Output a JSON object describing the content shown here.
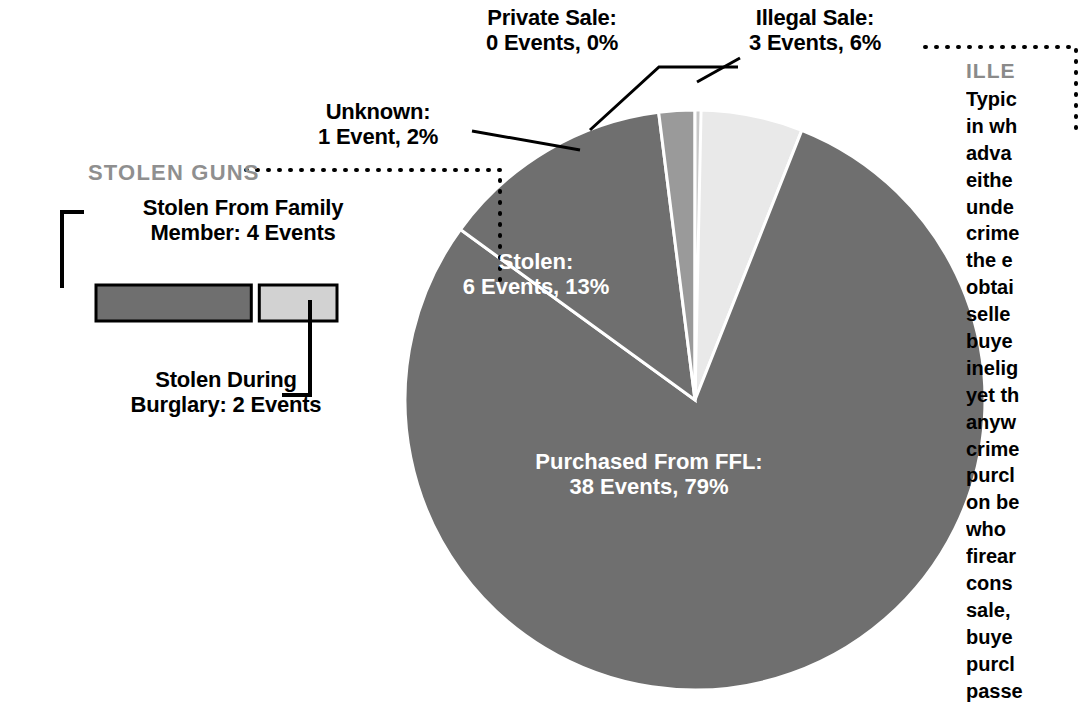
{
  "chart_data": {
    "type": "pie",
    "title": "",
    "value_unit": "Events",
    "total_events": 48,
    "center": {
      "x": 695,
      "y": 400
    },
    "radius": 290,
    "legend_position": "callouts",
    "slices": [
      {
        "name": "Purchased From FFL",
        "events": 38,
        "percent": 79,
        "label": "Purchased From FFL:",
        "value_text": "38 Events, 79%",
        "color": "#6f6f6f",
        "label_placement": "inside"
      },
      {
        "name": "Stolen",
        "events": 6,
        "percent": 13,
        "label": "Stolen:",
        "value_text": "6 Events, 13%",
        "color": "#6f6f6f",
        "label_placement": "inside"
      },
      {
        "name": "Unknown",
        "events": 1,
        "percent": 2,
        "label": "Unknown:",
        "value_text": "1 Event, 2%",
        "color": "#9a9a9a",
        "label_placement": "callout"
      },
      {
        "name": "Private Sale",
        "events": 0,
        "percent": 0,
        "label": "Private Sale:",
        "value_text": "0 Events, 0%",
        "color": "#c8c8c8",
        "label_placement": "callout"
      },
      {
        "name": "Illegal Sale",
        "events": 3,
        "percent": 6,
        "label": "Illegal Sale:",
        "value_text": "3 Events, 6%",
        "color": "#e9e9e9",
        "label_placement": "callout"
      }
    ]
  },
  "pie_labels": {
    "private_sale": {
      "line1": "Private Sale:",
      "line2": "0 Events, 0%"
    },
    "illegal_sale": {
      "line1": "Illegal Sale:",
      "line2": "3 Events, 6%"
    },
    "unknown": {
      "line1": "Unknown:",
      "line2": "1 Event, 2%"
    },
    "stolen": {
      "line1": "Stolen:",
      "line2": "6 Events, 13%"
    },
    "purchased_ffl": {
      "line1": "Purchased From FFL:",
      "line2": "38 Events, 79%"
    }
  },
  "stolen_guns_legend": {
    "title": "STOLEN GUNS",
    "title_color": "#8f8f8f",
    "breakdown": {
      "type": "bar",
      "categories": [
        "Stolen From Family Member",
        "Stolen During Burglary"
      ],
      "values": [
        4,
        2
      ],
      "total": 6
    },
    "family": {
      "line1": "Stolen From Family",
      "line2": "Member: 4 Events",
      "color": "#6f6f6f"
    },
    "burglary": {
      "line1": "Stolen During",
      "line2": "Burglary: 2 Events",
      "color": "#d2d2d2"
    }
  },
  "article": {
    "heading": "ILLE",
    "lines": [
      "Typic",
      "in wh",
      "adva",
      "eithe",
      "unde",
      "crime",
      "the e",
      "obtai",
      "selle",
      "buye",
      "inelig",
      "yet th",
      "anyw",
      "crime",
      "purcl",
      "on be",
      "who",
      "firear",
      "cons",
      "sale,",
      "buye",
      "purcl",
      "passe"
    ]
  },
  "colors": {
    "dark_gray": "#6f6f6f",
    "mid_gray": "#9a9a9a",
    "light_gray": "#c8c8c8",
    "lightest_gray": "#e9e9e9",
    "legend_light": "#d2d2d2",
    "text_gray": "#8f8f8f",
    "black": "#000000",
    "white": "#ffffff"
  }
}
